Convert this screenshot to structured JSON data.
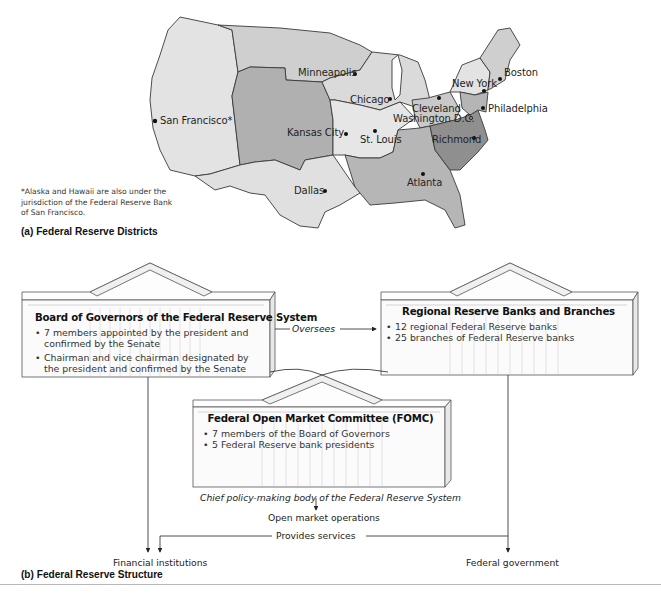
{
  "map": {
    "caption": "(a)  Federal Reserve Districts",
    "footnote": "*Alaska and Hawaii are also under the jurisdiction of the Federal Reserve Bank of San Francisco.",
    "cities": [
      {
        "name": "San Francisco*",
        "district": "San Francisco"
      },
      {
        "name": "Minneapolis",
        "district": "Minneapolis"
      },
      {
        "name": "Kansas City",
        "district": "Kansas City"
      },
      {
        "name": "Dallas",
        "district": "Dallas"
      },
      {
        "name": "Chicago",
        "district": "Chicago"
      },
      {
        "name": "St. Louis",
        "district": "St. Louis"
      },
      {
        "name": "Cleveland",
        "district": "Cleveland"
      },
      {
        "name": "Washington D.C.",
        "district": "Board of Governors"
      },
      {
        "name": "Richmond",
        "district": "Richmond"
      },
      {
        "name": "Atlanta",
        "district": "Atlanta"
      },
      {
        "name": "New York",
        "district": "New York"
      },
      {
        "name": "Philadelphia",
        "district": "Philadelphia"
      },
      {
        "name": "Boston",
        "district": "Boston"
      }
    ],
    "district_colors": {
      "light": "#e3e3e3",
      "medium_light": "#cfcfcf",
      "medium": "#b8b8b8",
      "dark": "#8f8f8f",
      "outline": "#3a3a3a"
    }
  },
  "structure": {
    "caption": "(b)  Federal Reserve Structure",
    "board": {
      "title": "Board of Governors of the Federal Reserve System",
      "bullets": [
        "7 members appointed by the president and confirmed by the Senate",
        "Chairman and vice chairman designated by the president and confirmed by the Senate"
      ]
    },
    "regional": {
      "title": "Regional Reserve Banks and Branches",
      "bullets": [
        "12 regional Federal Reserve banks",
        "25 branches of Federal Reserve banks"
      ]
    },
    "fomc": {
      "title": "Federal Open Market Committee (FOMC)",
      "bullets": [
        "7 members of the Board of Governors",
        "5 Federal Reserve bank presidents"
      ],
      "subtitle": "Chief policy-making body of the Federal Reserve System"
    },
    "flows": {
      "oversees": "Oversees",
      "open_market_operations": "Open market operations",
      "provides_services": "Provides services",
      "financial_institutions": "Financial institutions",
      "federal_government": "Federal government"
    }
  }
}
